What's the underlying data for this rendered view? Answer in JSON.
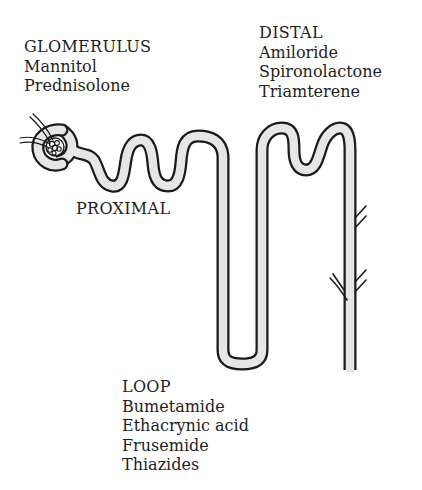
{
  "diagram": {
    "colors": {
      "tube_fill": "#e6e6e6",
      "tube_outline": "#1a1a1a",
      "text": "#1e1e1e",
      "background": "#ffffff"
    },
    "segments": [
      {
        "id": "glomerulus",
        "heading": "GLOMERULUS",
        "drugs": [
          "Mannitol",
          "Prednisolone"
        ]
      },
      {
        "id": "proximal",
        "heading": "PROXIMAL",
        "drugs": []
      },
      {
        "id": "distal",
        "heading": "DISTAL",
        "drugs": [
          "Amiloride",
          "Spironolactone",
          "Triamterene"
        ]
      },
      {
        "id": "loop",
        "heading": "LOOP",
        "drugs": [
          "Bumetamide",
          "Ethacrynic acid",
          "Frusemide",
          "Thiazides"
        ]
      }
    ]
  }
}
